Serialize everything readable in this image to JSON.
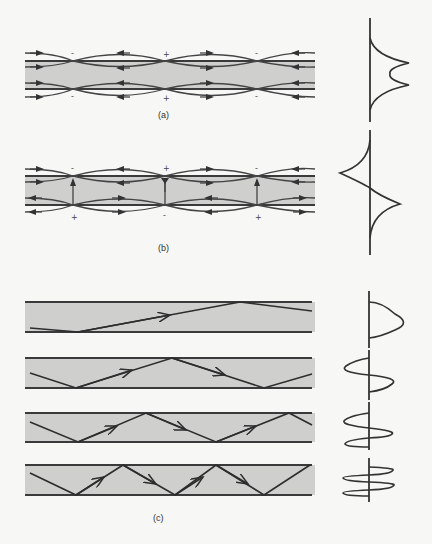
{
  "figure": {
    "panels": [
      {
        "id": "a",
        "label": "(a)",
        "description": "Slab waveguide, even mode: field lines with arrows outside and inside the slab; charge signs alternating along boundaries",
        "charges_top": [
          "-",
          "+",
          "-"
        ],
        "charges_bottom": [
          "-",
          "+",
          "-"
        ],
        "profile": "symmetric double-peak field profile"
      },
      {
        "id": "b",
        "label": "(b)",
        "description": "Slab waveguide, odd mode: field lines with vertical field arrows crossing slab at nodes",
        "charges_top": [
          "-",
          "+",
          "-"
        ],
        "charges_bottom": [
          "+",
          "-",
          "+"
        ],
        "profile": "antisymmetric field profile with opposite-signed cusps"
      },
      {
        "id": "c",
        "label": "(c)",
        "description": "Ray picture of guided modes in a slab waveguide, mode orders 0 to 3",
        "modes": [
          {
            "order": 0,
            "profile": "single lobe"
          },
          {
            "order": 1,
            "profile": "two lobes, opposite sign"
          },
          {
            "order": 2,
            "profile": "three lobes"
          },
          {
            "order": 3,
            "profile": "four lobes"
          }
        ]
      }
    ],
    "colors": {
      "slab_fill": "#cfcfcd",
      "line": "#333333",
      "background": "#f7f7f5"
    }
  }
}
